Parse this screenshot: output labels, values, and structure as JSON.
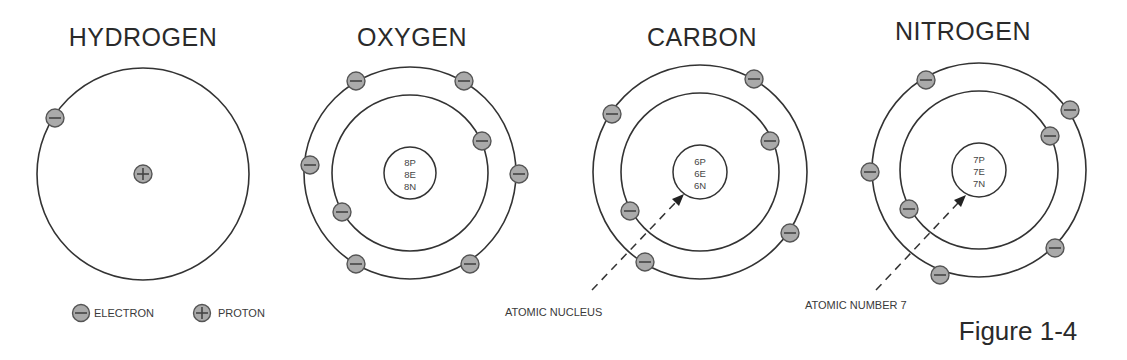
{
  "figure_label": "Figure 1-4",
  "atoms": [
    {
      "name": "HYDROGEN",
      "center": [
        143,
        174
      ],
      "orbits": [
        106
      ],
      "nucleus": {
        "type": "proton-symbol"
      },
      "electrons": [
        [
          55,
          118
        ]
      ]
    },
    {
      "name": "OXYGEN",
      "center": [
        410,
        173
      ],
      "orbits": [
        78,
        106
      ],
      "nucleus": {
        "radius": 26,
        "lines": [
          "8P",
          "8E",
          "8N"
        ]
      },
      "electrons": [
        [
          356,
          81
        ],
        [
          464,
          81
        ],
        [
          482,
          141
        ],
        [
          310,
          165
        ],
        [
          519,
          174
        ],
        [
          342,
          212
        ],
        [
          356,
          264
        ],
        [
          470,
          264
        ]
      ]
    },
    {
      "name": "CARBON",
      "center": [
        700,
        172
      ],
      "orbits": [
        79,
        107
      ],
      "nucleus": {
        "radius": 27,
        "lines": [
          "6P",
          "6E",
          "6N"
        ]
      },
      "electrons": [
        [
          612,
          114
        ],
        [
          754,
          79
        ],
        [
          770,
          141
        ],
        [
          630,
          211
        ],
        [
          645,
          262
        ],
        [
          790,
          233
        ]
      ]
    },
    {
      "name": "NITROGEN",
      "center": [
        979,
        170
      ],
      "orbits": [
        79,
        107
      ],
      "nucleus": {
        "radius": 27,
        "lines": [
          "7P",
          "7E",
          "7N"
        ]
      },
      "electrons": [
        [
          926,
          80
        ],
        [
          1070,
          110
        ],
        [
          1050,
          136
        ],
        [
          870,
          172
        ],
        [
          909,
          209
        ],
        [
          1055,
          248
        ],
        [
          940,
          275
        ]
      ]
    }
  ],
  "legend": {
    "electron_label": "ELECTRON",
    "proton_label": "PROTON"
  },
  "annotations": {
    "atomic_nucleus": "ATOMIC NUCLEUS",
    "atomic_number": "ATOMIC NUMBER 7"
  },
  "colors": {
    "particle_fill": "#aaaaaa",
    "stroke": "#333333",
    "text": "#2a2a2a"
  }
}
